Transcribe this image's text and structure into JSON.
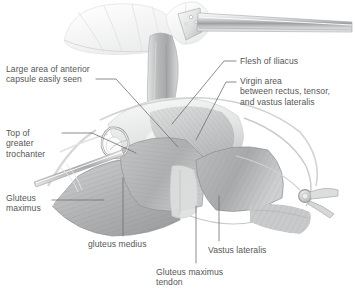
{
  "figure": {
    "kind": "anatomical-surgical-illustration",
    "palette": {
      "background": "#ffffff",
      "text": "#565656",
      "leader_line": "#6f6f6f",
      "muscle_mid": "#b9babb",
      "muscle_dark": "#9a9b9c",
      "muscle_light": "#d4d5d6",
      "capsule_pale": "#eceded",
      "fascia_light": "#e4e5e6",
      "metal_light": "#f2f3f3",
      "metal_mid": "#c9cacb",
      "metal_dark": "#a3a4a5"
    },
    "instruments": [
      {
        "name": "hohmann-retractor-top-right",
        "description": "perforated blade retractor entering from upper right"
      },
      {
        "name": "retractor-rod-left",
        "description": "straight retractor rod entering from lower left"
      },
      {
        "name": "hook-retractor-left",
        "description": "hooked retractor tip over greater trochanter"
      },
      {
        "name": "ring-retractor-right",
        "description": "ring retractor on right margin of wound"
      }
    ]
  },
  "labels": [
    {
      "id": "large-area-anterior-capsule",
      "text": "Large area of anterior\ncapsule easily seen",
      "x": 6,
      "y": 64,
      "align": "left"
    },
    {
      "id": "top-of-greater-trochanter",
      "text": "Top of\ngreater\ntrochanter",
      "x": 6,
      "y": 128,
      "align": "left"
    },
    {
      "id": "gluteus-maximus",
      "text": "Gluteus\nmaximus",
      "x": 6,
      "y": 193,
      "align": "left"
    },
    {
      "id": "flesh-of-iliacus",
      "text": "Flesh of Iliacus",
      "x": 240,
      "y": 56,
      "align": "left"
    },
    {
      "id": "virgin-area",
      "text": "Virgin area\nbetween rectus, tensor,\nand vastus lateralis",
      "x": 240,
      "y": 76,
      "align": "left"
    },
    {
      "id": "gluteus-medius",
      "text": "gluteus medius",
      "x": 88,
      "y": 239,
      "align": "left"
    },
    {
      "id": "vastus-lateralis",
      "text": "Vastus lateralis",
      "x": 208,
      "y": 245,
      "align": "left"
    },
    {
      "id": "gluteus-maximus-tendon",
      "text": "Gluteus maximus\ntendon",
      "x": 156,
      "y": 267,
      "align": "left"
    }
  ],
  "leaders": [
    {
      "id": "leader-anterior-capsule",
      "path": "M 96,79 L 116,79 L 178,147"
    },
    {
      "id": "leader-greater-trochanter",
      "path": "M 62,133 L 92,133 L 136,153"
    },
    {
      "id": "leader-gluteus-maximus",
      "path": "M 52,200 L 104,200"
    },
    {
      "id": "leader-flesh-iliacus",
      "path": "M 236,61 L 224,61 L 172,124"
    },
    {
      "id": "leader-virgin-area",
      "path": "M 236,82 L 226,82 L 196,140"
    },
    {
      "id": "leader-gluteus-medius",
      "path": "M 123,236 L 123,178"
    },
    {
      "id": "leader-vastus-lateralis",
      "path": "M 219,241 L 219,196"
    },
    {
      "id": "leader-gm-tendon",
      "path": "M 196,263 L 196,206"
    }
  ]
}
